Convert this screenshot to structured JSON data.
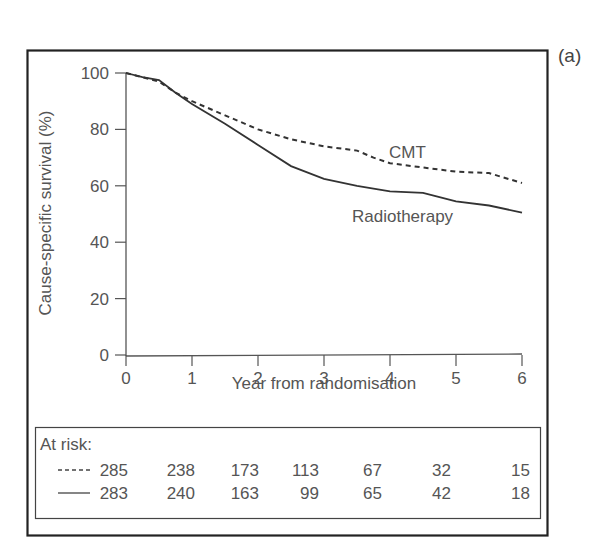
{
  "figure": {
    "panel_label": "(a)",
    "at_risk_heading": "At risk:"
  },
  "chart_data": {
    "type": "line",
    "title": "",
    "xlabel": "Year from randomisation",
    "ylabel": "Cause-specific survival (%)",
    "xlim": [
      0,
      6
    ],
    "ylim": [
      0,
      100
    ],
    "xticks": [
      0,
      1,
      2,
      3,
      4,
      5,
      6
    ],
    "yticks": [
      0,
      20,
      40,
      60,
      80,
      100
    ],
    "grid": false,
    "legend": "inline labels",
    "series": [
      {
        "name": "CMT",
        "style": "dashed",
        "x": [
          0,
          0.25,
          0.5,
          0.75,
          1,
          1.5,
          2,
          2.5,
          3,
          3.5,
          3.75,
          4,
          4.5,
          5,
          5.5,
          6
        ],
        "values": [
          100,
          98.5,
          97,
          93,
          90,
          85,
          80,
          76.5,
          74,
          72.5,
          70,
          68,
          66.5,
          65,
          64.5,
          61
        ]
      },
      {
        "name": "Radiotherapy",
        "style": "solid",
        "x": [
          0,
          0.25,
          0.5,
          0.75,
          1,
          1.5,
          2,
          2.5,
          3,
          3.5,
          4,
          4.5,
          4.75,
          5,
          5.5,
          6
        ],
        "values": [
          100,
          98.5,
          97.5,
          93,
          89,
          82,
          74.5,
          67,
          62.5,
          60,
          58,
          57.5,
          56,
          54.5,
          53,
          50.5
        ]
      }
    ],
    "at_risk": {
      "heading": "At risk:",
      "x": [
        0,
        1,
        2,
        3,
        4,
        5,
        6
      ],
      "rows": [
        {
          "series": "CMT",
          "style": "dashed",
          "values": [
            285,
            238,
            173,
            113,
            67,
            32,
            15
          ]
        },
        {
          "series": "Radiotherapy",
          "style": "solid",
          "values": [
            283,
            240,
            163,
            99,
            65,
            42,
            18
          ]
        }
      ]
    }
  }
}
